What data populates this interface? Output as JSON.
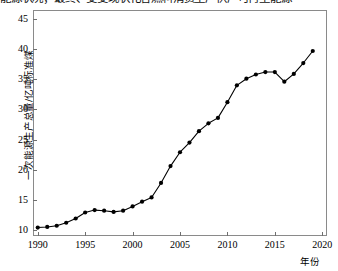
{
  "header": {
    "clipped_text": "能源状况；最终、变变现状化各燃料消费生产供产可再生能源"
  },
  "axes": {
    "x_label": "年份",
    "y_label": "一次能源生产总量/亿吨标准煤",
    "x_ticks": [
      "1990",
      "1995",
      "2000",
      "2005",
      "2010",
      "2015",
      "2020"
    ],
    "y_ticks": [
      "10",
      "15",
      "20",
      "25",
      "30",
      "35",
      "40",
      "45"
    ]
  },
  "chart_data": {
    "type": "line",
    "title": "",
    "subtitle": "",
    "xlabel": "年份",
    "ylabel": "一次能源生产总量/亿吨标准煤",
    "xlim": [
      1989.5,
      2020.5
    ],
    "ylim": [
      9.0,
      46.5
    ],
    "grid": false,
    "legend": null,
    "marker": "filled-circle",
    "line_color": "#000000",
    "marker_color": "#000000",
    "x": [
      1990,
      1991,
      1992,
      1993,
      1994,
      1995,
      1996,
      1997,
      1998,
      1999,
      2000,
      2001,
      2002,
      2003,
      2004,
      2005,
      2006,
      2007,
      2008,
      2009,
      2010,
      2011,
      2012,
      2013,
      2014,
      2015,
      2016,
      2017,
      2018,
      2019
    ],
    "values": [
      10.4,
      10.5,
      10.7,
      11.2,
      11.9,
      12.9,
      13.3,
      13.2,
      13.0,
      13.2,
      13.9,
      14.7,
      15.4,
      17.8,
      20.6,
      22.9,
      24.5,
      26.4,
      27.7,
      28.6,
      31.2,
      34.0,
      35.1,
      35.8,
      36.2,
      36.2,
      34.6,
      35.9,
      37.7,
      39.7
    ],
    "series": [
      {
        "name": "一次能源生产总量",
        "unit": "亿吨标准煤",
        "values": [
          10.4,
          10.5,
          10.7,
          11.2,
          11.9,
          12.9,
          13.3,
          13.2,
          13.0,
          13.2,
          13.9,
          14.7,
          15.4,
          17.8,
          20.6,
          22.9,
          24.5,
          26.4,
          27.7,
          28.6,
          31.2,
          34.0,
          35.1,
          35.8,
          36.2,
          36.2,
          34.6,
          35.9,
          37.7,
          39.7
        ]
      }
    ],
    "annotations": []
  }
}
